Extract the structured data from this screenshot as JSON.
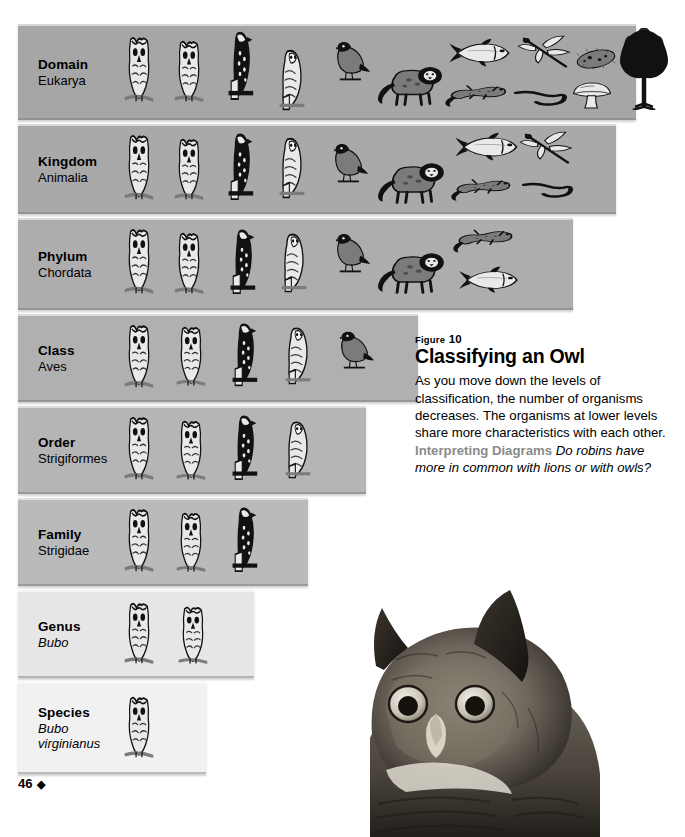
{
  "figure": {
    "kicker_label": "Figure",
    "kicker_number": "10",
    "title": "Classifying an Owl",
    "body": "As you move down the levels of classification, the number of organisms decreases. The organisms at lower levels share more characteristics with each other.",
    "lead_in": "Interpreting Diagrams",
    "question": "Do robins have more in common with lions or with owls?"
  },
  "folio": {
    "page_number": "46",
    "ornament": "◆"
  },
  "photo": {
    "caption_name": "great-horned-owl-photograph"
  },
  "colors": {
    "band_top": "#a8a8a8",
    "band_bottom": "#f0f0f0",
    "text": "#000000",
    "lead_in_gray": "#8a8a8a",
    "page_background": "#ffffff"
  },
  "levels": [
    {
      "rank": "Domain",
      "taxon": "Eukarya",
      "taxon_italic": false,
      "width": 618,
      "top": 24,
      "height": 96,
      "shade": "#a6a6a6",
      "organism_count": 12,
      "organisms": [
        {
          "kind": "owl-horned-front",
          "x": 0,
          "y": 8,
          "w": 42,
          "h": 70
        },
        {
          "kind": "owl-horned-front",
          "x": 50,
          "y": 12,
          "w": 42,
          "h": 66
        },
        {
          "kind": "hawk",
          "x": 100,
          "y": 2,
          "w": 44,
          "h": 74
        },
        {
          "kind": "barn-owl",
          "x": 152,
          "y": 20,
          "w": 44,
          "h": 66
        },
        {
          "kind": "robin",
          "x": 208,
          "y": 12,
          "w": 46,
          "h": 46
        },
        {
          "kind": "lion",
          "x": 256,
          "y": 30,
          "w": 70,
          "h": 52
        },
        {
          "kind": "fish",
          "x": 330,
          "y": 10,
          "w": 66,
          "h": 34
        },
        {
          "kind": "lizard",
          "x": 326,
          "y": 52,
          "w": 68,
          "h": 32
        },
        {
          "kind": "worm",
          "x": 396,
          "y": 58,
          "w": 56,
          "h": 26
        },
        {
          "kind": "dragonfly",
          "x": 398,
          "y": 6,
          "w": 58,
          "h": 42
        },
        {
          "kind": "paramecium",
          "x": 456,
          "y": 16,
          "w": 44,
          "h": 34
        },
        {
          "kind": "mushroom",
          "x": 452,
          "y": 50,
          "w": 44,
          "h": 34
        },
        {
          "kind": "tree",
          "x": 498,
          "y": 2,
          "w": 56,
          "h": 82
        }
      ]
    },
    {
      "rank": "Kingdom",
      "taxon": "Animalia",
      "taxon_italic": false,
      "width": 598,
      "top": 124,
      "height": 90,
      "shade": "#a9a9a9",
      "organism_count": 9,
      "organisms": [
        {
          "kind": "owl-horned-front",
          "x": 0,
          "y": 6,
          "w": 42,
          "h": 70
        },
        {
          "kind": "owl-horned-front",
          "x": 50,
          "y": 10,
          "w": 42,
          "h": 66
        },
        {
          "kind": "hawk",
          "x": 100,
          "y": 4,
          "w": 44,
          "h": 72
        },
        {
          "kind": "barn-owl",
          "x": 152,
          "y": 8,
          "w": 44,
          "h": 66
        },
        {
          "kind": "robin",
          "x": 206,
          "y": 14,
          "w": 46,
          "h": 46
        },
        {
          "kind": "lion",
          "x": 256,
          "y": 26,
          "w": 72,
          "h": 54
        },
        {
          "kind": "fish",
          "x": 336,
          "y": 4,
          "w": 68,
          "h": 34
        },
        {
          "kind": "lizard",
          "x": 332,
          "y": 46,
          "w": 66,
          "h": 32
        },
        {
          "kind": "worm",
          "x": 404,
          "y": 50,
          "w": 54,
          "h": 26
        },
        {
          "kind": "dragonfly",
          "x": 400,
          "y": 2,
          "w": 58,
          "h": 42
        }
      ]
    },
    {
      "rank": "Phylum",
      "taxon": "Chordata",
      "taxon_italic": false,
      "width": 555,
      "top": 218,
      "height": 92,
      "shade": "#adadad",
      "organism_count": 7,
      "organisms": [
        {
          "kind": "owl-horned-front",
          "x": 0,
          "y": 6,
          "w": 42,
          "h": 70
        },
        {
          "kind": "owl-horned-front",
          "x": 50,
          "y": 10,
          "w": 42,
          "h": 66
        },
        {
          "kind": "hawk",
          "x": 102,
          "y": 6,
          "w": 44,
          "h": 70
        },
        {
          "kind": "barn-owl",
          "x": 154,
          "y": 10,
          "w": 44,
          "h": 64
        },
        {
          "kind": "robin",
          "x": 208,
          "y": 10,
          "w": 46,
          "h": 46
        },
        {
          "kind": "lion",
          "x": 256,
          "y": 22,
          "w": 72,
          "h": 54
        },
        {
          "kind": "lizard",
          "x": 334,
          "y": 2,
          "w": 66,
          "h": 34
        },
        {
          "kind": "fish",
          "x": 340,
          "y": 44,
          "w": 64,
          "h": 32
        }
      ]
    },
    {
      "rank": "Class",
      "taxon": "Aves",
      "taxon_italic": false,
      "width": 400,
      "top": 314,
      "height": 88,
      "shade": "#b0b0b0",
      "organism_count": 5,
      "organisms": [
        {
          "kind": "owl-horned-front",
          "x": 0,
          "y": 6,
          "w": 42,
          "h": 68
        },
        {
          "kind": "owl-horned-front",
          "x": 52,
          "y": 8,
          "w": 42,
          "h": 64
        },
        {
          "kind": "hawk",
          "x": 104,
          "y": 4,
          "w": 44,
          "h": 68
        },
        {
          "kind": "barn-owl",
          "x": 158,
          "y": 8,
          "w": 44,
          "h": 62
        },
        {
          "kind": "robin",
          "x": 212,
          "y": 12,
          "w": 46,
          "h": 44
        }
      ]
    },
    {
      "rank": "Order",
      "taxon": "Strigiformes",
      "taxon_italic": false,
      "width": 348,
      "top": 406,
      "height": 88,
      "shade": "#b5b5b5",
      "organism_count": 4,
      "organisms": [
        {
          "kind": "owl-horned-front",
          "x": 0,
          "y": 6,
          "w": 42,
          "h": 68
        },
        {
          "kind": "owl-horned-front",
          "x": 52,
          "y": 10,
          "w": 42,
          "h": 64
        },
        {
          "kind": "hawk",
          "x": 104,
          "y": 4,
          "w": 44,
          "h": 70
        },
        {
          "kind": "barn-owl",
          "x": 158,
          "y": 10,
          "w": 44,
          "h": 62
        }
      ]
    },
    {
      "rank": "Family",
      "taxon": "Strigidae",
      "taxon_italic": false,
      "width": 290,
      "top": 498,
      "height": 88,
      "shade": "#bababa",
      "organism_count": 3,
      "organisms": [
        {
          "kind": "owl-horned-front",
          "x": 0,
          "y": 6,
          "w": 42,
          "h": 68
        },
        {
          "kind": "owl-horned-front",
          "x": 52,
          "y": 10,
          "w": 42,
          "h": 64
        },
        {
          "kind": "hawk",
          "x": 104,
          "y": 4,
          "w": 44,
          "h": 70
        }
      ]
    },
    {
      "rank": "Genus",
      "taxon": "Bubo",
      "taxon_italic": true,
      "width": 236,
      "top": 590,
      "height": 88,
      "shade": "#e6e6e6",
      "organism_count": 2,
      "organisms": [
        {
          "kind": "owl-horned-front",
          "x": 0,
          "y": 8,
          "w": 42,
          "h": 66
        },
        {
          "kind": "owl-horned-front",
          "x": 54,
          "y": 12,
          "w": 42,
          "h": 62
        }
      ]
    },
    {
      "rank": "Species",
      "taxon": "Bubo",
      "taxon_line2": "virginianus",
      "taxon_italic": true,
      "width": 188,
      "top": 682,
      "height": 92,
      "shade": "#f1f1f1",
      "organism_count": 1,
      "organisms": [
        {
          "kind": "owl-horned-front",
          "x": 0,
          "y": 10,
          "w": 42,
          "h": 66
        }
      ]
    }
  ]
}
